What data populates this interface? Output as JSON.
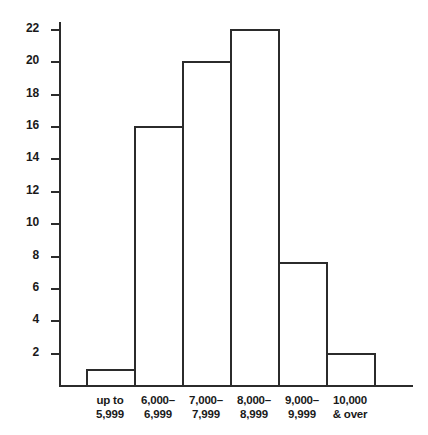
{
  "chart_data": {
    "type": "bar",
    "title": "",
    "subtitle": "",
    "xlabel": "",
    "ylabel": "",
    "categories": [
      "up to 5,999",
      "6,000–6,999",
      "7,000–7,999",
      "8,000–8,999",
      "9,000–9,999",
      "10,000 & over"
    ],
    "category_lines": [
      [
        "up to",
        "5,999"
      ],
      [
        "6,000–",
        "6,999"
      ],
      [
        "7,000–",
        "7,999"
      ],
      [
        "8,000–",
        "8,999"
      ],
      [
        "9,000–",
        "9,999"
      ],
      [
        "10,000",
        "& over"
      ]
    ],
    "values": [
      1,
      16,
      20,
      22,
      7.6,
      2
    ],
    "ylim": [
      0,
      23.5
    ],
    "yticks": [
      2,
      4,
      6,
      8,
      10,
      12,
      14,
      16,
      18,
      20,
      22
    ],
    "ytick_labels": [
      "2",
      "4",
      "6",
      "8",
      "10",
      "12",
      "14",
      "16",
      "18",
      "20",
      "22"
    ],
    "grid": false,
    "legend": null,
    "bar_style": "outline",
    "colors": {
      "axis": "#2b2b2b",
      "bar_outline": "#2b2b2b",
      "bar_fill": "#ffffff",
      "text": "#1a1a1a",
      "background": "#ffffff"
    }
  },
  "layout": {
    "plot_left_px": 59,
    "plot_baseline_px": 385,
    "plot_top_px": 22,
    "axis_right_px": 413,
    "bars_start_px": 86,
    "bar_width_px": 48,
    "px_per_unit": 16.18
  }
}
